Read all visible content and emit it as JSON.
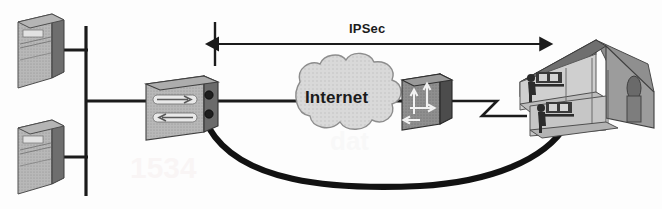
{
  "diagram": {
    "type": "network-topology",
    "background_color": "#fdfdfd",
    "palette": {
      "line": "#1b1b1b",
      "device_light": "#d0d0d0",
      "device_mid": "#a8a8a8",
      "device_dark": "#707070",
      "device_darker": "#4e4e4e",
      "cloud_fill": "#d7d7d7",
      "cloud_stroke": "#8d8d8d",
      "text": "#1b1b1b",
      "tunnel": "#121212"
    },
    "labels": {
      "ipsec": "IPSec",
      "internet": "Internet"
    },
    "nodes": [
      {
        "id": "server-top",
        "name": "server",
        "label": "",
        "x": 10,
        "y": 14,
        "w": 54,
        "h": 74
      },
      {
        "id": "server-bottom",
        "name": "server",
        "label": "",
        "x": 10,
        "y": 120,
        "w": 54,
        "h": 74
      },
      {
        "id": "vpn-concentrator",
        "name": "vpn-concentrator",
        "label": "",
        "x": 140,
        "y": 76,
        "w": 78,
        "h": 56
      },
      {
        "id": "internet-cloud",
        "name": "internet-cloud",
        "label": "Internet",
        "x": 282,
        "y": 62,
        "w": 112,
        "h": 80
      },
      {
        "id": "router",
        "name": "router",
        "label": "",
        "x": 396,
        "y": 72,
        "w": 56,
        "h": 52
      },
      {
        "id": "home-office",
        "name": "home-office-building",
        "label": "",
        "x": 512,
        "y": 32,
        "w": 142,
        "h": 104
      }
    ],
    "links": [
      {
        "id": "bus-backbone",
        "name": "ethernet-bus",
        "style": "solid"
      },
      {
        "id": "drop-server-top",
        "name": "server-drop-link",
        "style": "solid"
      },
      {
        "id": "drop-server-bot",
        "name": "server-drop-link",
        "style": "solid"
      },
      {
        "id": "bus-to-vpn",
        "name": "lan-link",
        "style": "solid"
      },
      {
        "id": "vpn-to-internet",
        "name": "wan-link",
        "style": "solid"
      },
      {
        "id": "internet-to-router",
        "name": "wan-link",
        "style": "solid"
      },
      {
        "id": "router-to-home",
        "name": "serial-zigzag-link",
        "style": "zigzag"
      },
      {
        "id": "ipsec-span",
        "name": "ipsec-double-arrow",
        "style": "double-arrow"
      },
      {
        "id": "vpn-tunnel",
        "name": "vpn-tunnel-curve",
        "style": "thick-curve"
      }
    ]
  }
}
